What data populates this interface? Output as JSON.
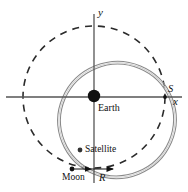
{
  "figure": {
    "background_color": "#ffffff",
    "width": 188,
    "height": 192
  },
  "axes": {
    "x_label": "x",
    "y_label": "y",
    "color": "#555555",
    "origin": {
      "x": 94,
      "y": 97
    },
    "x_axis": {
      "x1": 6,
      "y1": 97,
      "x2": 182,
      "y2": 97
    },
    "y_axis": {
      "x1": 94,
      "y1": 14,
      "x2": 94,
      "y2": 183
    }
  },
  "labels": {
    "earth": "Earth",
    "satellite": "Satellite",
    "moon": "Moon",
    "point_s": "S",
    "radius_r": "R"
  },
  "bodies": {
    "earth": {
      "cx": 94,
      "cy": 96,
      "r": 6.2,
      "color": "#111111"
    },
    "satellite": {
      "cx": 80,
      "cy": 150,
      "r": 2.3,
      "color": "#333333"
    },
    "moon": {
      "cx": 72,
      "cy": 169,
      "r": 2.3,
      "color": "#111111"
    },
    "point_s": {
      "cx": 165,
      "cy": 97,
      "r": 1.8,
      "color": "#111111"
    }
  },
  "curves": {
    "moon_orbit": {
      "style": "dashed",
      "cx": 94,
      "cy": 97,
      "r": 71,
      "color": "#2b2b2b",
      "dash": "7 6",
      "width": 1.6
    },
    "satellite_orbit": {
      "style": "solid-double",
      "cx": 117,
      "cy": 120,
      "rx": 58,
      "ry": 57,
      "rotation": -22,
      "color": "#7a7a7a",
      "width": 1.1
    }
  },
  "annotations": {
    "radius_arrow": {
      "from_x": 72,
      "to_x": 114,
      "y": 169,
      "color": "#111111"
    }
  }
}
